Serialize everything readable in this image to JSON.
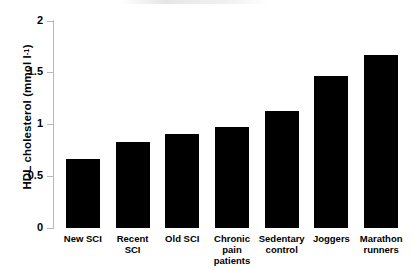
{
  "chart_data": {
    "type": "bar",
    "title": "",
    "subtitle": "",
    "xlabel": "",
    "ylabel": "HDL cholesterol (mmol l",
    "ylabel_exponent": "-1",
    "ylabel_suffix": ")",
    "ylim": [
      0,
      2
    ],
    "yticks": [
      "0",
      "0.5",
      "1",
      "1.5",
      "2"
    ],
    "ytick_values": [
      0,
      0.5,
      1,
      1.5,
      2
    ],
    "grid": false,
    "legend": false,
    "bar_color": "#000000",
    "axis_color": "#b9b9b9",
    "background_color": "#ffffff",
    "categories": [
      "New SCI",
      "Recent SCI",
      "Old SCI",
      "Chronic pain\npatients",
      "Sedentary\ncontrol",
      "Joggers",
      "Marathon\nrunners"
    ],
    "values": [
      0.67,
      0.83,
      0.91,
      0.97,
      1.13,
      1.47,
      1.67
    ]
  }
}
